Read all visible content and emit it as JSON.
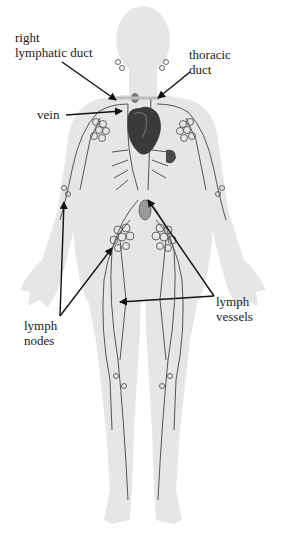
{
  "diagram": {
    "colors": {
      "background": "#ffffff",
      "body": "#e6e6e6",
      "vessel": "#555555",
      "heart": "#3a3a3a",
      "arrow": "#111111",
      "text": "#1a1a1a"
    },
    "labels": {
      "right_lymphatic_duct": {
        "line1": "right",
        "line2": "lymphatic duct"
      },
      "thoracic_duct": {
        "line1": "thoracic",
        "line2": "duct"
      },
      "vein": {
        "text": "vein"
      },
      "lymph_nodes": {
        "line1": "lymph",
        "line2": "nodes"
      },
      "lymph_vessels": {
        "line1": "lymph",
        "line2": "vessels"
      }
    }
  }
}
